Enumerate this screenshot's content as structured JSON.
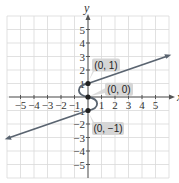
{
  "chart_data": {
    "type": "line",
    "title": "",
    "xlabel": "x",
    "ylabel": "y",
    "xlim": [
      -6,
      6
    ],
    "ylim": [
      -6,
      6
    ],
    "grid": true,
    "x_ticks": [
      "-5",
      "-4",
      "-3",
      "-2",
      "-1",
      "1",
      "2",
      "3",
      "4",
      "5"
    ],
    "y_ticks": [
      "5",
      "4",
      "3",
      "2",
      "1",
      "-1",
      "-2",
      "-3",
      "-4",
      "-5"
    ],
    "series": [
      {
        "name": "upper ray",
        "points": [
          [
            0,
            1
          ],
          [
            5.8,
            3
          ]
        ]
      },
      {
        "name": "s-curve",
        "points": [
          [
            0,
            1
          ],
          [
            -0.6,
            0.5
          ],
          [
            0,
            0
          ],
          [
            0.6,
            -0.5
          ],
          [
            0,
            -1
          ]
        ]
      },
      {
        "name": "lower ray",
        "points": [
          [
            0,
            -1
          ],
          [
            -5.8,
            -3
          ]
        ]
      }
    ],
    "annotations": [
      {
        "label": "(0, 1)",
        "x": 0,
        "y": 1
      },
      {
        "label": "(0, 0)",
        "x": 0,
        "y": 0
      },
      {
        "label": "(0, −1)",
        "x": 0,
        "y": -1
      }
    ],
    "colors": {
      "curve": "#5a6470",
      "grid": "#d9d9d9",
      "label_bg": "#d6d6d6"
    }
  }
}
